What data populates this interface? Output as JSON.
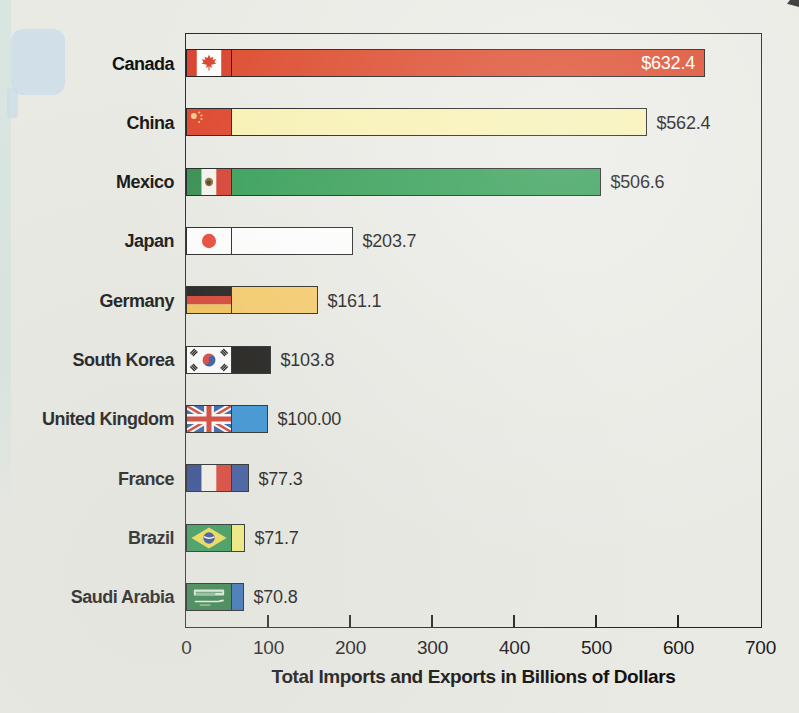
{
  "page": {
    "background_color": "#EAEAE5",
    "decorations": {
      "note_bubble_color": "#CADCE8",
      "left_band_color": "#D9E5E1",
      "corner_mark_color": "#2F2F2F"
    }
  },
  "chart_data": {
    "type": "bar",
    "orientation": "horizontal",
    "title": "",
    "xlabel": "Total Imports and Exports in Billions of Dollars",
    "ylabel": "",
    "xlim": [
      0,
      700
    ],
    "xticks": [
      0,
      100,
      200,
      300,
      400,
      500,
      600,
      700
    ],
    "grid": false,
    "legend": false,
    "axis_color": "#242424",
    "bar_border_color": "#1C1C1C",
    "text_color": "#101010",
    "inside_label_color": "#FFFFFF",
    "categories": [
      "Canada",
      "China",
      "Mexico",
      "Japan",
      "Germany",
      "South Korea",
      "United Kingdom",
      "France",
      "Brazil",
      "Saudi Arabia"
    ],
    "values": [
      632.4,
      562.4,
      506.6,
      203.7,
      161.1,
      103.8,
      100.0,
      77.3,
      71.7,
      70.8
    ],
    "value_labels": [
      "$632.4",
      "$562.4",
      "$506.6",
      "$203.7",
      "$161.1",
      "$103.8",
      "$100.00",
      "$77.3",
      "$71.7",
      "$70.8"
    ],
    "bar_colors": [
      "#DC4A2C",
      "#F8F1B3",
      "#2F9C52",
      "#FFFFFF",
      "#F7C963",
      "#0D0C0A",
      "#2E8DD4",
      "#31509E",
      "#F3EE78",
      "#2F6CB6"
    ],
    "flags": [
      "canada",
      "china",
      "mexico",
      "japan",
      "germany",
      "south-korea",
      "united-kingdom",
      "france",
      "brazil",
      "saudi-arabia"
    ],
    "value_label_inside": [
      true,
      false,
      false,
      false,
      false,
      false,
      false,
      false,
      false,
      false
    ]
  }
}
